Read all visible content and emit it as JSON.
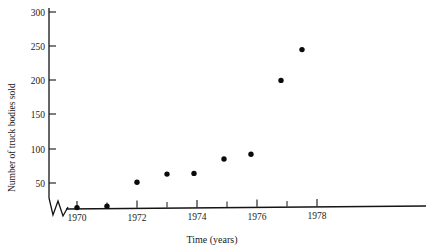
{
  "chart_data": {
    "type": "scatter",
    "title": "",
    "xlabel": "Time (years)",
    "ylabel": "Number of truck bodies sold",
    "xlim": [
      1969.0,
      1980.0
    ],
    "ylim": [
      0,
      310
    ],
    "grid": false,
    "legend": "none",
    "axis_break": {
      "present": true,
      "axis": "y",
      "symbol": "zigzag",
      "note": "broken axis near origin"
    },
    "x_ticks_major": [
      1970,
      1972,
      1974,
      1976,
      1978
    ],
    "x_tick_labels": [
      "1970",
      "1972",
      "1974",
      "1976",
      "1978"
    ],
    "x_ticks_minor": [
      1971,
      1973,
      1975,
      1977
    ],
    "y_ticks": [
      50,
      100,
      150,
      200,
      250,
      300
    ],
    "y_tick_labels": [
      "50",
      "100",
      "150",
      "200",
      "250",
      "300"
    ],
    "series": [
      {
        "name": "Truck bodies sold",
        "marker": "filled-circle",
        "color": "#0b0b0b",
        "points": [
          {
            "x": 1970.0,
            "y": 14
          },
          {
            "x": 1971.0,
            "y": 16
          },
          {
            "x": 1972.0,
            "y": 51
          },
          {
            "x": 1973.0,
            "y": 63
          },
          {
            "x": 1973.9,
            "y": 64
          },
          {
            "x": 1974.9,
            "y": 85
          },
          {
            "x": 1975.8,
            "y": 92
          },
          {
            "x": 1976.8,
            "y": 200
          },
          {
            "x": 1977.5,
            "y": 245
          }
        ]
      }
    ]
  },
  "colors": {
    "axis": "#141414",
    "marker": "#0b0b0b",
    "background": "#ffffff"
  }
}
